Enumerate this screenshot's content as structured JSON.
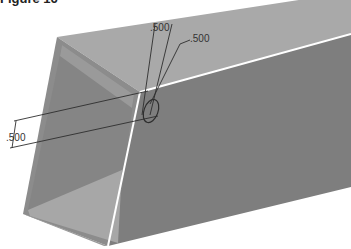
{
  "figure": {
    "caption": "Figure 16"
  },
  "dimensions": {
    "top_left": ".500",
    "top_right": ".500",
    "side": ".500"
  },
  "colors": {
    "top_face": "#a9a9a9",
    "side_face": "#7e7e7e",
    "inner_left_wall": "#8a8a8a",
    "inner_bottom": "#a5a5a5",
    "edge_highlight": "#ffffff",
    "dimension_line": "#2e2e2e"
  }
}
